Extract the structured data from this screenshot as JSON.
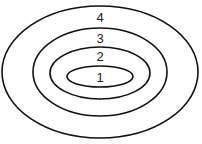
{
  "diagram": {
    "type": "nested-ellipses",
    "stroke_color": "#111111",
    "label_color": "#222222",
    "layers": [
      {
        "label": "1",
        "cx": 100,
        "cy": 76.5,
        "rx": 33,
        "ry": 10.5,
        "label_x": 100,
        "label_y": 82
      },
      {
        "label": "2",
        "cx": 100,
        "cy": 73,
        "rx": 50,
        "ry": 26,
        "label_x": 100,
        "label_y": 61
      },
      {
        "label": "3",
        "cx": 100,
        "cy": 72,
        "rx": 67,
        "ry": 44,
        "label_x": 100,
        "label_y": 43
      },
      {
        "label": "4",
        "cx": 100,
        "cy": 72,
        "rx": 98,
        "ry": 66,
        "label_x": 100,
        "label_y": 22
      }
    ]
  }
}
